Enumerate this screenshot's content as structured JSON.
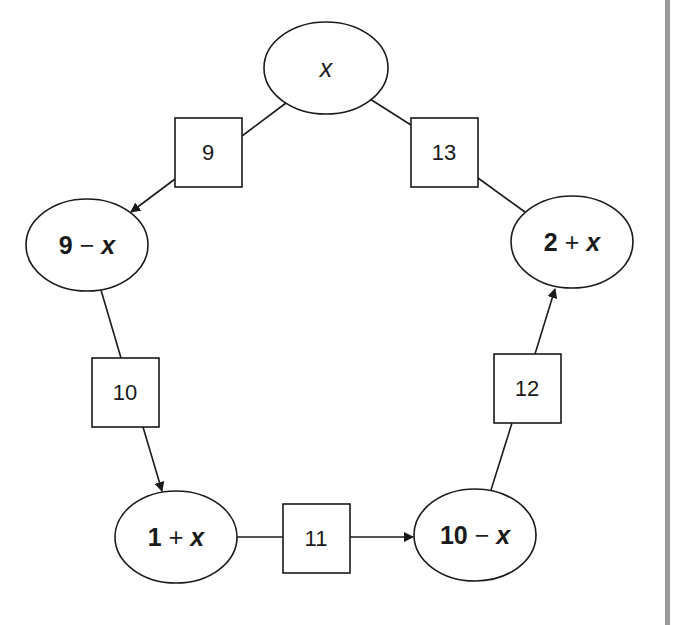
{
  "diagram": {
    "nodes": [
      {
        "id": "top",
        "label": "x",
        "cx": 326,
        "cy": 68,
        "rx": 62,
        "ry": 46
      },
      {
        "id": "left",
        "label": "9 − x",
        "cx": 87,
        "cy": 245,
        "rx": 61,
        "ry": 46
      },
      {
        "id": "right",
        "label": "2 + x",
        "cx": 572,
        "cy": 242,
        "rx": 61,
        "ry": 46
      },
      {
        "id": "bottom-left",
        "label": "1 + x",
        "cx": 176,
        "cy": 537,
        "rx": 61,
        "ry": 46
      },
      {
        "id": "bottom-right",
        "label": "10 − x",
        "cx": 475,
        "cy": 535,
        "rx": 61,
        "ry": 46
      }
    ],
    "boxes": [
      {
        "id": "box-9",
        "label": "9",
        "x": 175,
        "y": 118,
        "w": 67,
        "h": 69
      },
      {
        "id": "box-13",
        "label": "13",
        "x": 411,
        "y": 118,
        "w": 67,
        "h": 69
      },
      {
        "id": "box-10",
        "label": "10",
        "x": 92,
        "y": 358,
        "w": 67,
        "h": 69
      },
      {
        "id": "box-11",
        "label": "11",
        "x": 283,
        "y": 504,
        "w": 67,
        "h": 69
      },
      {
        "id": "box-12",
        "label": "12",
        "x": 494,
        "y": 354,
        "w": 67,
        "h": 69
      }
    ],
    "edges": [
      {
        "from": "top",
        "to": "left",
        "via": "9",
        "arrow": "left"
      },
      {
        "from": "left",
        "to": "bottom-left",
        "via": "10",
        "arrow": "bottom-left"
      },
      {
        "from": "bottom-left",
        "to": "bottom-right",
        "via": "11",
        "arrow": "bottom-right"
      },
      {
        "from": "bottom-right",
        "to": "right",
        "via": "12",
        "arrow": "right"
      },
      {
        "from": "right",
        "to": "top",
        "via": "13",
        "arrow": "none"
      }
    ]
  },
  "labels": {
    "top": "x",
    "left_num": "9",
    "left_op": " − ",
    "left_var": "x",
    "right_num": "2",
    "right_op": " + ",
    "right_var": "x",
    "bl_num": "1",
    "bl_op": " + ",
    "bl_var": "x",
    "br_num": "10",
    "br_op": " − ",
    "br_var": "x",
    "box_9": "9",
    "box_10": "10",
    "box_11": "11",
    "box_12": "12",
    "box_13": "13"
  },
  "colors": {
    "stroke": "#1a1a1a",
    "background": "#ffffff",
    "side_bar": "#9a9a9a"
  }
}
